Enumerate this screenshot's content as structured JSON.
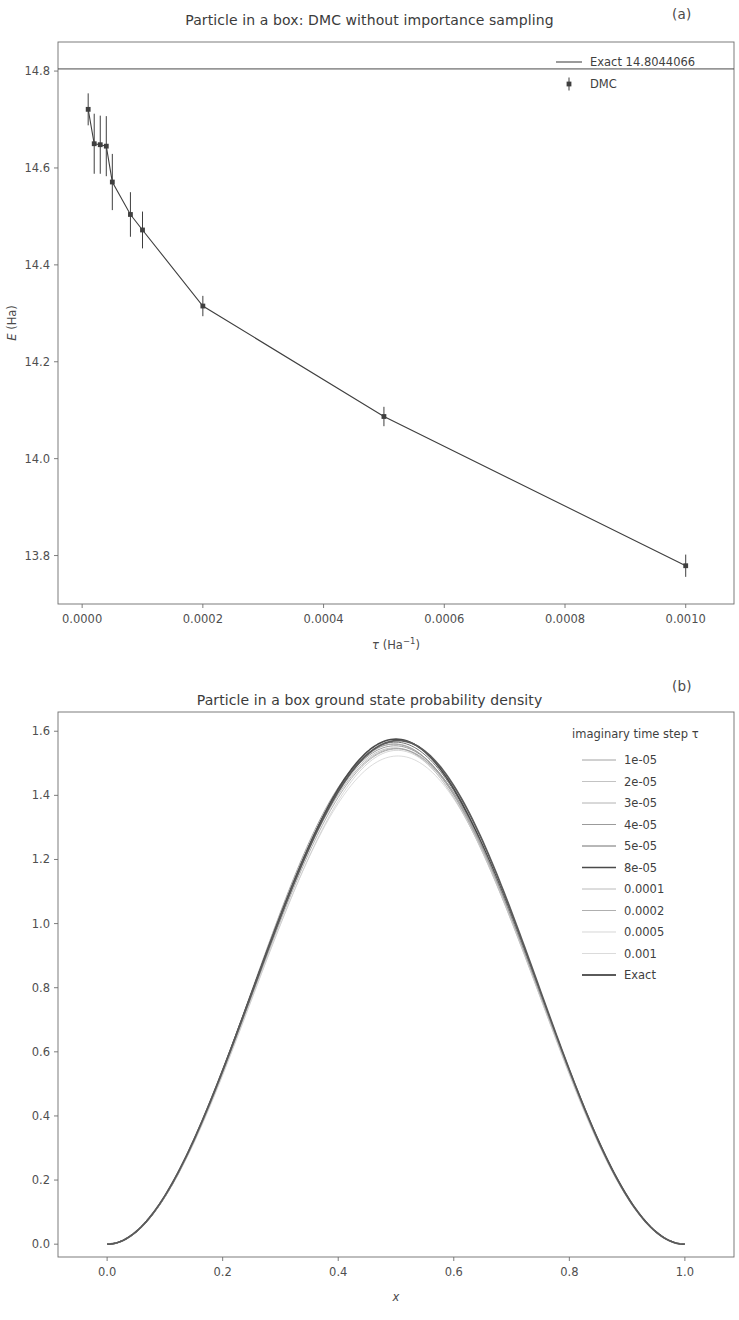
{
  "figure": {
    "panel_a_label": "(a)",
    "panel_b_label": "(b)"
  },
  "panel_a": {
    "title": "Particle in a box: DMC without importance sampling",
    "legend": {
      "exact_label": "Exact 14.8044066",
      "dmc_label": "DMC"
    },
    "axis": {
      "xlabel_symbol": "τ",
      "xlabel_units": "(Ha",
      "xlabel_exponent": "−1",
      "xlabel_close": ")",
      "ylabel_symbol": "E",
      "ylabel_units": "(Ha)"
    },
    "xticks": [
      "0.0000",
      "0.0002",
      "0.0004",
      "0.0006",
      "0.0008",
      "0.0010"
    ],
    "yticks": [
      "14.8",
      "14.6",
      "14.4",
      "14.2",
      "14.0",
      "13.8"
    ]
  },
  "panel_b": {
    "title": "Particle in a box ground state probability density",
    "legend_title": "imaginary time step τ",
    "legend_items": [
      "1e-05",
      "2e-05",
      "3e-05",
      "4e-05",
      "5e-05",
      "8e-05",
      "0.0001",
      "0.0002",
      "0.0005",
      "0.001",
      "Exact"
    ],
    "axis": {
      "xlabel": "x"
    },
    "xticks": [
      "0.0",
      "0.2",
      "0.4",
      "0.6",
      "0.8",
      "1.0"
    ],
    "yticks": [
      "0.0",
      "0.2",
      "0.4",
      "0.6",
      "0.8",
      "1.0",
      "1.2",
      "1.4",
      "1.6"
    ]
  },
  "chart_data": [
    {
      "type": "line",
      "panel": "a",
      "title": "Particle in a box: DMC without importance sampling",
      "xlabel": "τ (Ha⁻¹)",
      "ylabel": "E (Ha)",
      "xlim": [
        -4e-05,
        0.00108
      ],
      "ylim": [
        13.7,
        14.86
      ],
      "xticks": [
        0.0,
        0.0002,
        0.0004,
        0.0006,
        0.0008,
        0.001
      ],
      "yticks": [
        14.8,
        14.6,
        14.4,
        14.2,
        14.0,
        13.8
      ],
      "grid": false,
      "legend_position": "upper right",
      "hlines": [
        {
          "label": "Exact 14.8044066",
          "value": 14.8044066,
          "color": "#4a4a4a"
        }
      ],
      "series": [
        {
          "name": "DMC",
          "color": "#3f3f3f",
          "marker": "errorbar",
          "x": [
            1e-05,
            2e-05,
            3e-05,
            4e-05,
            5e-05,
            8e-05,
            0.0001,
            0.0002,
            0.0005,
            0.001
          ],
          "y": [
            14.721,
            14.65,
            14.648,
            14.645,
            14.571,
            14.504,
            14.472,
            14.315,
            14.087,
            13.779
          ],
          "yerr": [
            0.033,
            0.062,
            0.06,
            0.062,
            0.058,
            0.046,
            0.038,
            0.021,
            0.02,
            0.023
          ]
        }
      ]
    },
    {
      "type": "line",
      "panel": "b",
      "title": "Particle in a box ground state probability density",
      "xlabel": "x",
      "ylabel": "",
      "xlim": [
        -0.085,
        1.085
      ],
      "ylim": [
        -0.04,
        1.66
      ],
      "xticks": [
        0.0,
        0.2,
        0.4,
        0.6,
        0.8,
        1.0
      ],
      "yticks": [
        0.0,
        0.2,
        0.4,
        0.6,
        0.8,
        1.0,
        1.2,
        1.4,
        1.6
      ],
      "grid": false,
      "legend_title": "imaginary time step τ",
      "legend_position": "upper right",
      "description": "Overlaid sin^2 probability densities peaking near 1.57 at x = 0.5, all vanishing at x = 0 and x = 1",
      "series": [
        {
          "name": "1e-05",
          "peak": 1.565,
          "color": "#8c8c8c",
          "linewidth": 0.8,
          "amplitude": 1.565
        },
        {
          "name": "2e-05",
          "peak": 1.548,
          "color": "#b4b4b4",
          "linewidth": 0.8,
          "amplitude": 1.548
        },
        {
          "name": "3e-05",
          "peak": 1.555,
          "color": "#a0a0a0",
          "linewidth": 0.8,
          "amplitude": 1.555
        },
        {
          "name": "4e-05",
          "peak": 1.56,
          "color": "#909090",
          "linewidth": 0.9,
          "amplitude": 1.56
        },
        {
          "name": "5e-05",
          "peak": 1.566,
          "color": "#707070",
          "linewidth": 1.0,
          "amplitude": 1.566
        },
        {
          "name": "8e-05",
          "peak": 1.57,
          "color": "#4a4a4a",
          "linewidth": 1.6,
          "amplitude": 1.57
        },
        {
          "name": "0.0001",
          "peak": 1.552,
          "color": "#a8a8a8",
          "linewidth": 0.8,
          "amplitude": 1.552
        },
        {
          "name": "0.0002",
          "peak": 1.545,
          "color": "#9a9a9a",
          "linewidth": 0.8,
          "amplitude": 1.545
        },
        {
          "name": "0.0005",
          "peak": 1.535,
          "color": "#c4c4c4",
          "linewidth": 0.7,
          "amplitude": 1.535
        },
        {
          "name": "0.001",
          "peak": 1.528,
          "color": "#cccccc",
          "linewidth": 0.7,
          "amplitude": 1.528
        },
        {
          "name": "Exact",
          "peak": 1.571,
          "color": "#5a5a5a",
          "linewidth": 1.8,
          "amplitude": 1.5708
        }
      ]
    }
  ]
}
